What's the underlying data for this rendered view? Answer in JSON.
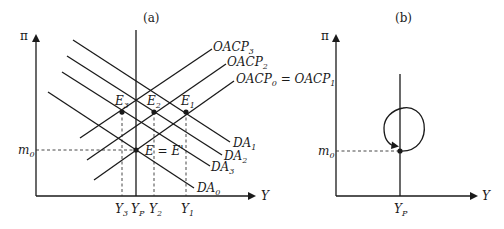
{
  "panels": [
    {
      "id": "a",
      "title": "(a)",
      "y_axis_label": "π",
      "x_axis_label": "Y",
      "reference_level": {
        "label": "m",
        "sub": "0"
      },
      "curves": {
        "da": [
          {
            "label": "DA",
            "sub": "1"
          },
          {
            "label": "DA",
            "sub": "2"
          },
          {
            "label": "DA",
            "sub": "3"
          },
          {
            "label": "DA",
            "sub": "0"
          }
        ],
        "oacp": [
          {
            "label": "OACP",
            "sub": "3"
          },
          {
            "label": "OACP",
            "sub": "2"
          },
          {
            "label": "OACP",
            "sub": "0",
            "suffix": " = OACP",
            "suffix_sub": "1"
          }
        ]
      },
      "points": [
        {
          "label": "E",
          "sub": "3"
        },
        {
          "label": "E",
          "sub": "2"
        },
        {
          "label": "E",
          "sub": "1"
        },
        {
          "label": "E = E'",
          "sub": ""
        }
      ],
      "x_ticks": [
        {
          "label": "Y",
          "sub": "3"
        },
        {
          "label": "Y",
          "sub": "P"
        },
        {
          "label": "Y",
          "sub": "2"
        },
        {
          "label": "Y",
          "sub": "1"
        }
      ]
    },
    {
      "id": "b",
      "title": "(b)",
      "y_axis_label": "π",
      "x_axis_label": "Y",
      "reference_level": {
        "label": "m",
        "sub": "0"
      },
      "x_ticks": [
        {
          "label": "Y",
          "sub": "P"
        }
      ]
    }
  ]
}
